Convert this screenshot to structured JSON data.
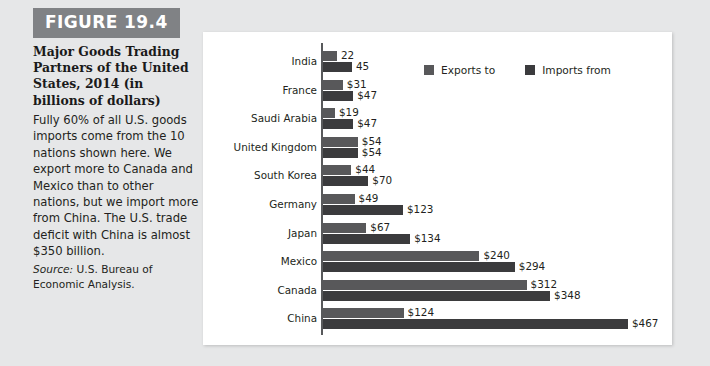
{
  "figure": {
    "badge": "FIGURE 19.4",
    "title": "Major Goods Trading Partners of the United States, 2014 (in billions of dollars)",
    "caption": "Fully 60% of all U.S. goods imports come from the 10 nations shown here. We export more to Canada and Mexico than to other nations, but we import more from China. The U.S. trade deficit with China is almost $350 billion.",
    "source_label": "Source:",
    "source_text": " U.S. Bureau of Economic Analysis."
  },
  "colors": {
    "page_background": "#e6e7e8",
    "panel_background": "#ffffff",
    "badge_background": "#808285",
    "exports_bar": "#58585a",
    "imports_bar": "#3b3b3d",
    "axis_line": "#58595b",
    "text": "#231f20"
  },
  "chart_data": {
    "type": "bar",
    "orientation": "horizontal",
    "title": "Major Goods Trading Partners of the United States, 2014 (in billions of dollars)",
    "xlabel": "",
    "ylabel": "",
    "unit": "billions of dollars",
    "grid": false,
    "legend_position": "top-right",
    "xlim": [
      0,
      500
    ],
    "categories": [
      "India",
      "France",
      "Saudi Arabia",
      "United Kingdom",
      "South Korea",
      "Germany",
      "Japan",
      "Mexico",
      "Canada",
      "China"
    ],
    "series": [
      {
        "name": "Exports to",
        "color": "#58585a",
        "values": [
          22,
          31,
          19,
          54,
          44,
          49,
          67,
          240,
          312,
          124
        ],
        "labels": [
          "22",
          "$31",
          "$19",
          "$54",
          "$44",
          "$49",
          "$67",
          "$240",
          "$312",
          "$124"
        ]
      },
      {
        "name": "Imports from",
        "color": "#3b3b3d",
        "values": [
          45,
          47,
          47,
          54,
          70,
          123,
          134,
          294,
          348,
          467
        ],
        "labels": [
          "45",
          "$47",
          "$47",
          "$54",
          "$70",
          "$123",
          "$134",
          "$294",
          "$348",
          "$467"
        ]
      }
    ]
  }
}
